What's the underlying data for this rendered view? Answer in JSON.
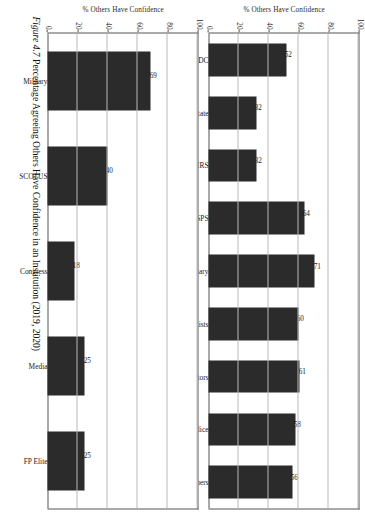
{
  "figure": {
    "number_label": "Figure 4.7",
    "caption_text": "Percentage Agreeing Others Have Confidence in an Institution (2019, 2020)"
  },
  "axis": {
    "y_title": "% Others Have Confidence",
    "ticks": [
      "0",
      "20",
      "40",
      "60",
      "80",
      "100"
    ]
  },
  "chart_data": [
    {
      "type": "bar",
      "panel": "top",
      "orientation": "vertical",
      "title": "",
      "xlabel": "",
      "ylabel": "% Others Have Confidence",
      "ylim": [
        0,
        100
      ],
      "yticks": [
        0,
        20,
        40,
        60,
        80,
        100
      ],
      "grid": true,
      "legend": "none",
      "categories": [
        "CDC",
        "State",
        "IRS",
        "USPS",
        "Military",
        "Scientists",
        "Doctors",
        "Police",
        "Teachers"
      ],
      "values": [
        52,
        32,
        32,
        64,
        71,
        60,
        61,
        58,
        56
      ],
      "data_labels": [
        "52",
        "32",
        "32",
        "64",
        "71",
        "60",
        "61",
        "58",
        "56"
      ],
      "bar_color": "#2b2b2b"
    },
    {
      "type": "bar",
      "panel": "bottom",
      "orientation": "vertical",
      "title": "",
      "xlabel": "",
      "ylabel": "% Others Have Confidence",
      "ylim": [
        0,
        100
      ],
      "yticks": [
        0,
        20,
        40,
        60,
        80,
        100
      ],
      "grid": true,
      "legend": "none",
      "categories": [
        "Military",
        "SCOTUS",
        "Congress",
        "Media",
        "FP Elite"
      ],
      "values": [
        69,
        40,
        18,
        25,
        25
      ],
      "data_labels": [
        "69",
        "40",
        "18",
        "25",
        "25"
      ],
      "bar_color": "#2b2b2b"
    }
  ]
}
